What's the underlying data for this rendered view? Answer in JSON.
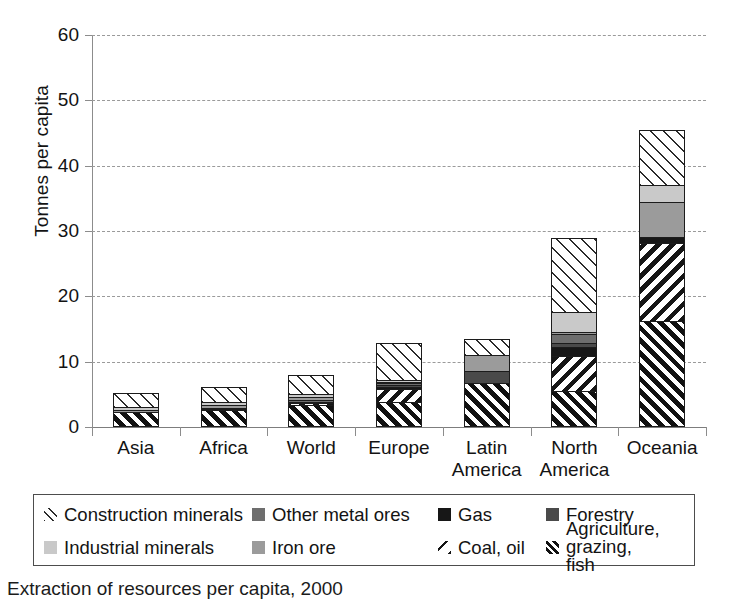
{
  "chart_data": {
    "type": "bar",
    "subtype": "stacked-vertical",
    "title": "",
    "xlabel": "",
    "ylabel": "Tonnes per capita",
    "ylim": [
      0,
      60
    ],
    "yticks": [
      0,
      10,
      20,
      30,
      40,
      50,
      60
    ],
    "grid": "horizontal-dashed",
    "legend_position": "bottom",
    "categories": [
      "Asia",
      "Africa",
      "World",
      "Europe",
      "Latin America",
      "North America",
      "Oceania"
    ],
    "category_lines": [
      [
        "Asia"
      ],
      [
        "Africa"
      ],
      [
        "World"
      ],
      [
        "Europe"
      ],
      [
        "Latin",
        "America"
      ],
      [
        "North",
        "America"
      ],
      [
        "Oceania"
      ]
    ],
    "series": [
      {
        "name": "Agriculture, grazing, fish",
        "key": "agriculture",
        "pattern": "diagonal-hatch-dense",
        "values": [
          2.3,
          2.6,
          3.4,
          3.8,
          6.8,
          5.5,
          16.3
        ]
      },
      {
        "name": "Coal, oil",
        "key": "coaloil",
        "pattern": "diagonal-hatch-backslash",
        "values": [
          0.0,
          0.0,
          0.3,
          2.0,
          0.0,
          5.4,
          11.9
        ]
      },
      {
        "name": "Gas",
        "key": "gas",
        "pattern": "solid-black",
        "values": [
          0.0,
          0.0,
          0.0,
          0.4,
          0.0,
          1.4,
          0.9
        ]
      },
      {
        "name": "Forestry",
        "key": "forestry",
        "pattern": "solid-dark-gray",
        "values": [
          0.0,
          0.15,
          0.2,
          0.3,
          1.7,
          0.6,
          0.0
        ]
      },
      {
        "name": "Other metal ores",
        "key": "othermetal",
        "pattern": "solid-mid-gray",
        "values": [
          0.0,
          0.15,
          0.2,
          0.2,
          0.0,
          1.3,
          0.0
        ]
      },
      {
        "name": "Iron ore",
        "key": "ironore",
        "pattern": "solid-gray",
        "values": [
          0.35,
          0.4,
          0.5,
          0.2,
          2.5,
          0.4,
          5.4
        ]
      },
      {
        "name": "Industrial minerals",
        "key": "industrial",
        "pattern": "solid-light-gray",
        "values": [
          0.45,
          0.5,
          0.5,
          0.3,
          0.0,
          3.0,
          2.6
        ]
      },
      {
        "name": "Construction minerals",
        "key": "construction",
        "pattern": "diagonal-hatch-light",
        "values": [
          2.1,
          2.3,
          2.9,
          5.6,
          2.5,
          11.4,
          8.4
        ]
      }
    ],
    "totals": [
      5.2,
      6.1,
      8.0,
      12.8,
      13.5,
      29.0,
      45.5
    ]
  },
  "axis": {
    "ylabel": "Tonnes per capita",
    "ytick_labels": [
      "0",
      "10",
      "20",
      "30",
      "40",
      "50",
      "60"
    ]
  },
  "legend": {
    "items": [
      {
        "label": "Construction minerals",
        "key": "construction"
      },
      {
        "label": "Other metal ores",
        "key": "othermetal"
      },
      {
        "label": "Gas",
        "key": "gas"
      },
      {
        "label": "Forestry",
        "key": "forestry"
      },
      {
        "label": "Industrial minerals",
        "key": "industrial"
      },
      {
        "label": "Iron ore",
        "key": "ironore"
      },
      {
        "label": "Coal, oil",
        "key": "coaloil"
      },
      {
        "label": "Agriculture, grazing,\nfish",
        "key": "agriculture"
      }
    ]
  },
  "caption": {
    "text": "Extraction of resources per capita, 2000"
  },
  "colors": {
    "gas": "#171717",
    "forestry": "#4a4a4a",
    "othermetal": "#6e6e6e",
    "ironore": "#9b9b9b",
    "industrial": "#c9c9c9",
    "hatch": "#1c1c1c",
    "gridline": "#9a9a9a",
    "axis": "#8c8c8c",
    "text": "#131313"
  }
}
